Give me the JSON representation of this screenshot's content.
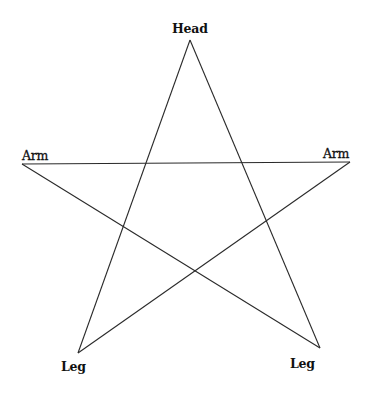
{
  "diagram": {
    "type": "pentagram",
    "line_color": "#2a2a2a",
    "labels": {
      "head": "Head",
      "arm_left": "Arm",
      "arm_right": "Arm",
      "leg_left": "Leg",
      "leg_right": "Leg"
    },
    "points": {
      "head": [
        190,
        40
      ],
      "arm_left": [
        22,
        164
      ],
      "arm_right": [
        350,
        162
      ],
      "leg_left": [
        78,
        353
      ],
      "leg_right": [
        320,
        348
      ]
    }
  }
}
